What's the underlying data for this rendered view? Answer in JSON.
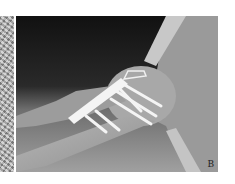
{
  "figure": {
    "panel_label": "B"
  },
  "colors": {
    "background": "#ffffff",
    "soft_tissue_dark": "#141414",
    "bone_gray": "#9a9a9a",
    "implant_white": "#f4f4f4"
  }
}
